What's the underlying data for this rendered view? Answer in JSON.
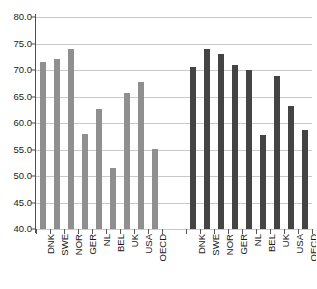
{
  "chart_data": {
    "type": "bar",
    "title": "",
    "subtitle": "",
    "xlabel": "",
    "ylabel": "",
    "ylim": [
      40.0,
      80.0
    ],
    "ytick_step": 5.0,
    "yticks": [
      "80.0",
      "75.0",
      "70.0",
      "65.0",
      "60.0",
      "55.0",
      "50.0",
      "45.0",
      "40.0"
    ],
    "ytick_values": [
      80.0,
      75.0,
      70.0,
      65.0,
      60.0,
      55.0,
      50.0,
      45.0,
      40.0
    ],
    "grid": true,
    "legend": "none",
    "legend_position": "none",
    "categories": [
      "DNK",
      "SWE",
      "NOR",
      "GER",
      "NL",
      "BEL",
      "UK",
      "USA",
      "OECD"
    ],
    "groups": [
      {
        "name": "group-1",
        "color": "#8f8f8f",
        "categories": [
          "DNK",
          "SWE",
          "NOR",
          "GER",
          "NL",
          "BEL",
          "UK",
          "USA",
          "OECD"
        ],
        "values": [
          71.5,
          72.0,
          74.0,
          58.0,
          62.7,
          51.5,
          65.7,
          67.7,
          55.1
        ]
      },
      {
        "name": "group-2",
        "color": "#444444",
        "categories": [
          "DNK",
          "SWE",
          "NOR",
          "GER",
          "NL",
          "BEL",
          "UK",
          "USA",
          "OECD"
        ],
        "values": [
          70.5,
          74.0,
          73.0,
          71.0,
          70.0,
          57.8,
          68.8,
          63.2,
          58.6
        ]
      }
    ],
    "colors": {
      "group_1_bar": "#8f8f8f",
      "group_2_bar": "#444444",
      "gridline": "#c9c9c9",
      "axis": "#4d4d4d",
      "text": "#1a1a1a",
      "background": "#ffffff"
    }
  }
}
